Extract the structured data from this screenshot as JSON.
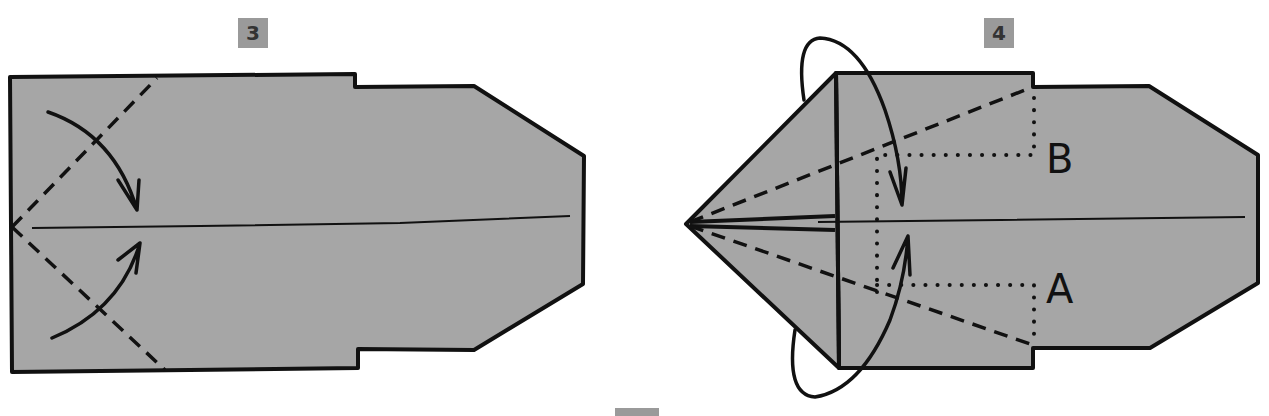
{
  "steps": [
    {
      "number": "3"
    },
    {
      "number": "4",
      "labels": {
        "upper": "B",
        "lower": "A"
      }
    }
  ],
  "colors": {
    "paper": "#a6a6a6",
    "line": "#111111",
    "badge": "#9a9a9a"
  }
}
